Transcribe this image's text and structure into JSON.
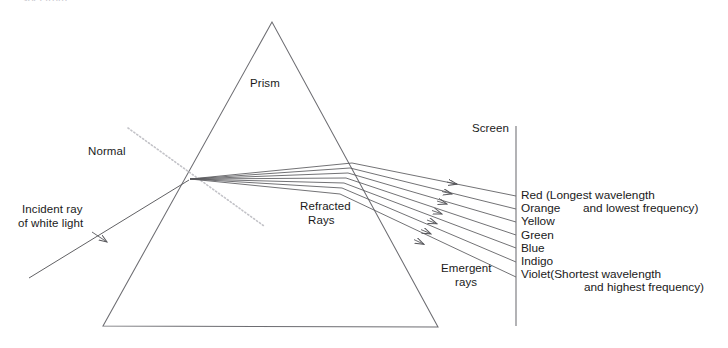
{
  "diagram": {
    "cropped_top_text": "spectrum",
    "labels": {
      "prism": "Prism",
      "normal": "Normal",
      "incident_line1": "Incident ray",
      "incident_line2": "of white light",
      "refracted_line1": "Refracted",
      "refracted_line2": "Rays",
      "emergent_line1": "Emergent",
      "emergent_line2": "rays",
      "screen": "Screen"
    },
    "spectrum": [
      {
        "name": "Red",
        "note": "(Longest wavelength"
      },
      {
        "name": "Orange",
        "note": ""
      },
      {
        "name": "Yellow",
        "note": ""
      },
      {
        "name": "Green",
        "note": ""
      },
      {
        "name": "Blue",
        "note": ""
      },
      {
        "name": "Indigo",
        "note": ""
      },
      {
        "name": "Violet",
        "note": "(Shortest wavelength"
      }
    ],
    "notes": {
      "red_second_line": "and lowest frequency)",
      "violet_second_line": "and highest frequency)"
    },
    "colors": {
      "stroke": "#58585c",
      "normal_dotted": "#c3c3c8",
      "text": "#1a1a1a",
      "background": "#ffffff"
    },
    "geometry": {
      "prism_apex": "272,22",
      "prism_base_left": "103,326",
      "prism_base_right": "438,327",
      "refraction_point": "190,179",
      "screen_x": 516,
      "screen_top": 126,
      "screen_bottom": 326,
      "ray_count": 7
    }
  }
}
